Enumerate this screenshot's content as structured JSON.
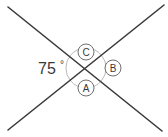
{
  "figure": {
    "type": "geometry-diagram",
    "background_color": "#ffffff",
    "line_color": "#3a3a3a",
    "arc_color": "#b4b4b4",
    "circle_color": "#6e6e6e",
    "text_color": "#3a3a3a",
    "intersection": {
      "x": 86,
      "y": 68
    },
    "lines": [
      {
        "name": "line-down-right",
        "x1": 8,
        "y1": 7,
        "x2": 162,
        "y2": 131
      },
      {
        "name": "line-up-right",
        "x1": 8,
        "y1": 130,
        "x2": 164,
        "y2": 5
      }
    ],
    "angle_label": {
      "value": "75",
      "degree_symbol": "°",
      "x": 38,
      "y": 74
    },
    "arcs": [
      {
        "name": "arc-left",
        "position": "left"
      },
      {
        "name": "arc-top",
        "position": "top"
      },
      {
        "name": "arc-right",
        "position": "right"
      },
      {
        "name": "arc-bottom",
        "position": "bottom"
      }
    ],
    "circled_labels": [
      {
        "id": "label-c",
        "text": "C",
        "cx": 86,
        "cy": 52,
        "r": 8,
        "position": "top"
      },
      {
        "id": "label-b",
        "text": "B",
        "cx": 113,
        "cy": 68,
        "r": 8,
        "position": "right"
      },
      {
        "id": "label-a",
        "text": "A",
        "cx": 86,
        "cy": 88,
        "r": 8,
        "position": "bottom"
      }
    ]
  }
}
